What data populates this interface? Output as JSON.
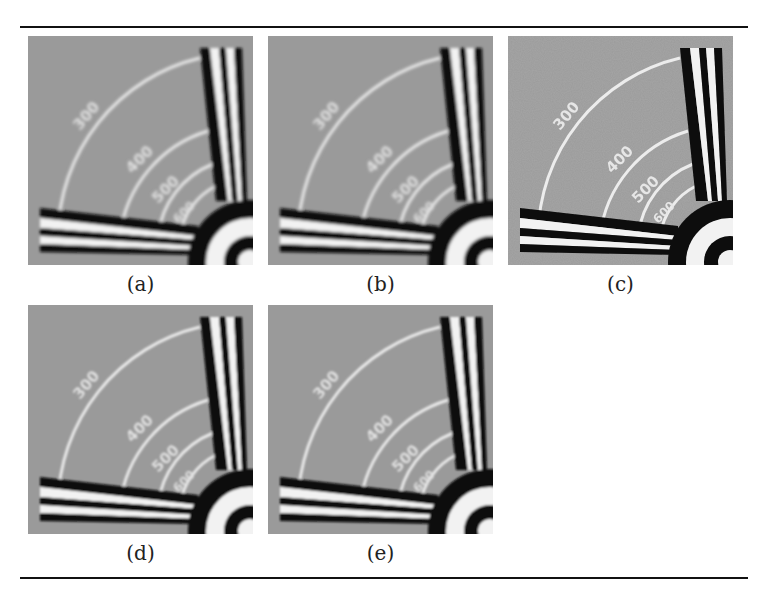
{
  "figure": {
    "panels": [
      {
        "id": "a",
        "caption": "(a)",
        "blur": 1.6,
        "noise": false
      },
      {
        "id": "b",
        "caption": "(b)",
        "blur": 1.4,
        "noise": false
      },
      {
        "id": "c",
        "caption": "(c)",
        "blur": 0.6,
        "noise": true
      },
      {
        "id": "d",
        "caption": "(d)",
        "blur": 0.9,
        "noise": false
      },
      {
        "id": "e",
        "caption": "(e)",
        "blur": 0.8,
        "noise": false
      }
    ],
    "chart_labels": [
      "300",
      "400",
      "500",
      "600"
    ],
    "colors": {
      "background": "#9a9a9a",
      "bars_dark": "#0a0a0a",
      "bars_light": "#f2f2f2",
      "arcs": "#e8e8e8",
      "rule": "#111111"
    }
  },
  "bleed_through_text": "number of SR procedures ... the different"
}
